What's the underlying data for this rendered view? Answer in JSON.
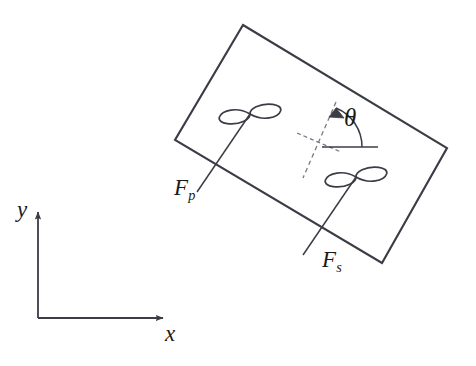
{
  "figure": {
    "background_color": "#ffffff",
    "stroke_color": "#3c3c46",
    "text_color": "#1a1a1a",
    "width": 476,
    "height": 366
  },
  "labels": {
    "force_port": "F",
    "force_port_sub": "p",
    "force_starboard": "F",
    "force_starboard_sub": "s",
    "heading_angle": "θ",
    "axis_x": "x",
    "axis_y": "y"
  },
  "hull": {
    "name": "rotated-rectangle",
    "corners": [
      {
        "x": 243,
        "y": 25
      },
      {
        "x": 447,
        "y": 148
      },
      {
        "x": 382,
        "y": 263
      },
      {
        "x": 175,
        "y": 140
      }
    ],
    "rotation_deg": -31
  },
  "propellers": [
    {
      "id": "port",
      "label": "F_p",
      "hub": {
        "x": 250,
        "y": 114
      },
      "shaft_start": {
        "x": 250,
        "y": 114
      },
      "shaft_end": {
        "x": 197,
        "y": 192
      },
      "blade_angle_deg": -31
    },
    {
      "id": "starboard",
      "label": "F_s",
      "hub": {
        "x": 356,
        "y": 177
      },
      "shaft_start": {
        "x": 356,
        "y": 177
      },
      "shaft_end": {
        "x": 303,
        "y": 255
      },
      "blade_angle_deg": -31
    }
  ],
  "heading_marker": {
    "center": {
      "x": 320,
      "y": 147
    },
    "body_axis_start": {
      "x": 336,
      "y": 102
    },
    "body_axis_end": {
      "x": 303,
      "y": 178
    },
    "cross_axis_start": {
      "x": 297,
      "y": 133
    },
    "cross_axis_end": {
      "x": 341,
      "y": 152
    },
    "reference_line_start": {
      "x": 322,
      "y": 147
    },
    "reference_line_end": {
      "x": 378,
      "y": 147
    },
    "arc_radius": 42,
    "arc_from_deg": 0,
    "arc_to_deg": 66,
    "arrow_tip": {
      "x": 333,
      "y": 109
    }
  },
  "coordinate_frame": {
    "origin": {
      "x": 38,
      "y": 318
    },
    "x_axis_end": {
      "x": 168,
      "y": 318
    },
    "y_axis_end": {
      "x": 38,
      "y": 207
    }
  }
}
